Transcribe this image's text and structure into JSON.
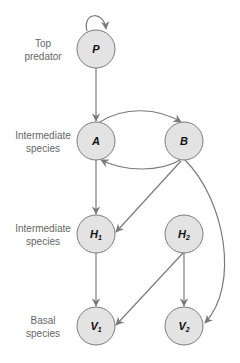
{
  "levels": [
    {
      "line1": "Top",
      "line2": "predator"
    },
    {
      "line1": "Intermediate",
      "line2": "species"
    },
    {
      "line1": "Intermediate",
      "line2": "species"
    },
    {
      "line1": "Basal",
      "line2": "species"
    }
  ],
  "nodes": {
    "P": {
      "main": "P",
      "sub": ""
    },
    "A": {
      "main": "A",
      "sub": ""
    },
    "B": {
      "main": "B",
      "sub": ""
    },
    "H1": {
      "main": "H",
      "sub": "1"
    },
    "H2": {
      "main": "H",
      "sub": "2"
    },
    "V1": {
      "main": "V",
      "sub": "1"
    },
    "V2": {
      "main": "V",
      "sub": "2"
    }
  },
  "edges": [
    {
      "from": "P",
      "to": "P"
    },
    {
      "from": "P",
      "to": "A"
    },
    {
      "from": "A",
      "to": "B"
    },
    {
      "from": "B",
      "to": "A"
    },
    {
      "from": "A",
      "to": "H1"
    },
    {
      "from": "B",
      "to": "H1"
    },
    {
      "from": "B",
      "to": "V2"
    },
    {
      "from": "H1",
      "to": "V1"
    },
    {
      "from": "H2",
      "to": "V1"
    },
    {
      "from": "H2",
      "to": "V2"
    }
  ],
  "colors": {
    "node_fill": "#e3e3e3",
    "node_stroke": "#7a7a7a",
    "edge": "#7a7a7a",
    "label_text": "#666666"
  }
}
